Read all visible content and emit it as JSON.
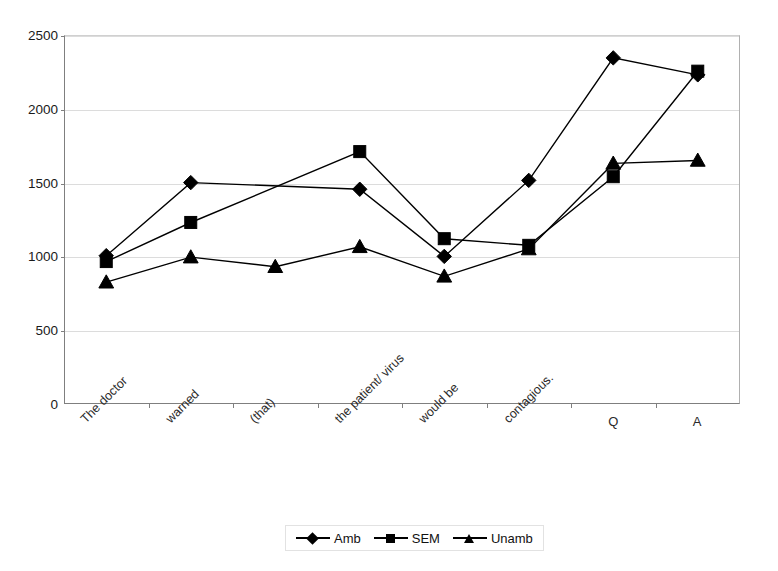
{
  "chart_data": {
    "type": "line",
    "title": "",
    "xlabel": "",
    "ylabel": "",
    "ylim": [
      0,
      2500
    ],
    "yticks": [
      0,
      500,
      1000,
      1500,
      2000,
      2500
    ],
    "grid": true,
    "legend_position": "bottom",
    "categories": [
      "The doctor",
      "warned",
      "(that)",
      "the patient/ virus",
      "would be",
      "contagious.",
      "Q",
      "A"
    ],
    "series": [
      {
        "name": "Amb",
        "marker": "diamond",
        "values": [
          1005,
          1500,
          null,
          1455,
          1000,
          1515,
          2345,
          2230
        ]
      },
      {
        "name": "SEM",
        "marker": "square",
        "values": [
          965,
          1230,
          null,
          1710,
          1120,
          1075,
          1540,
          2255
        ]
      },
      {
        "name": "Unamb",
        "marker": "triangle",
        "values": [
          825,
          995,
          930,
          1065,
          865,
          1050,
          1630,
          1650
        ]
      }
    ]
  },
  "axis": {
    "y_tick_labels": [
      "2500",
      "2000",
      "1500",
      "1000",
      "500",
      "0"
    ],
    "x_tick_labels": [
      "The doctor",
      "warned",
      "(that)",
      "the patient/ virus",
      "would be",
      "contagious.",
      "Q",
      "A"
    ]
  },
  "legend": {
    "items": [
      {
        "label": "Amb",
        "marker": "diamond"
      },
      {
        "label": "SEM",
        "marker": "square"
      },
      {
        "label": "Unamb",
        "marker": "triangle"
      }
    ]
  },
  "colors": {
    "series": "#000000",
    "gridline": "#dcdcdc",
    "axis": "#7f7f7f",
    "background": "#ffffff"
  }
}
